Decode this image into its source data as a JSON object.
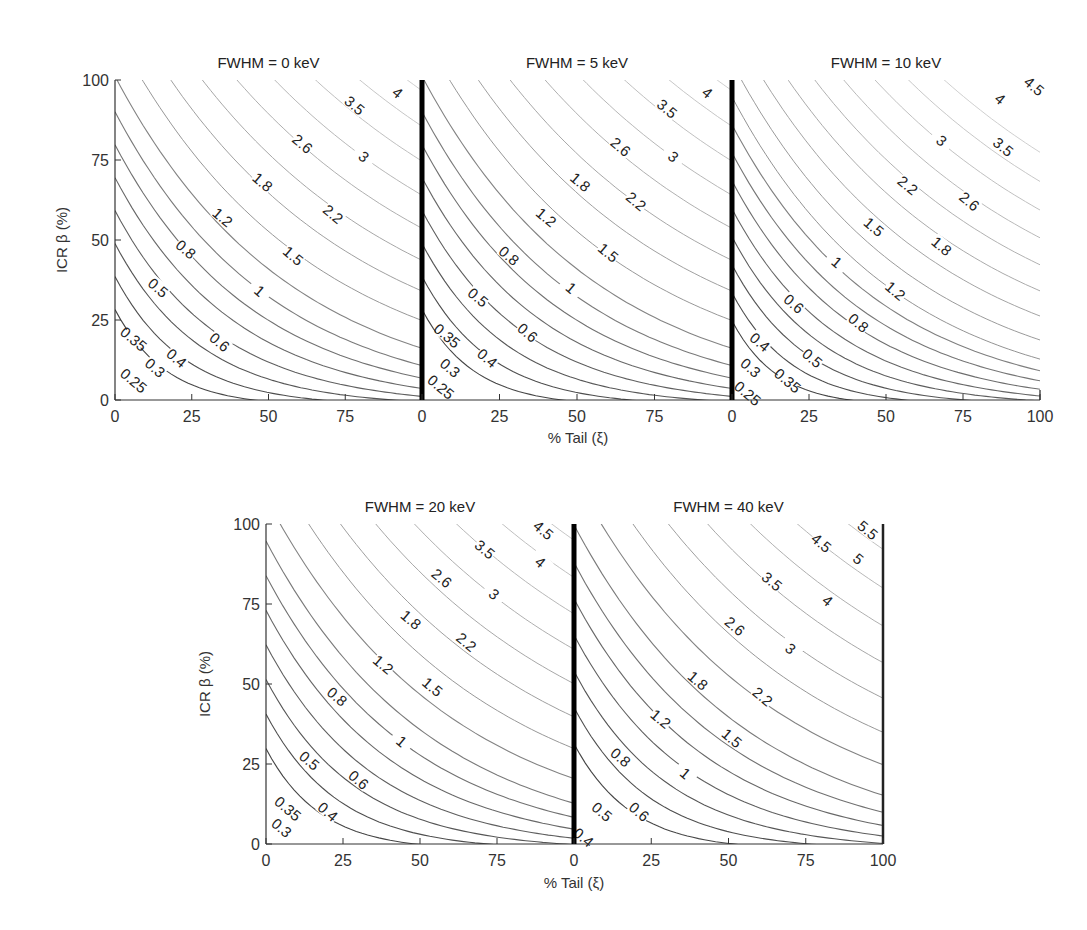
{
  "chart_data": {
    "type": "contour",
    "xlabel": "% Tail (ξ)",
    "ylabel": "ICR β (%)",
    "xlim": [
      0,
      100
    ],
    "ylim": [
      0,
      100
    ],
    "x_ticks": [
      "0",
      "25",
      "50",
      "75"
    ],
    "x_ticks_last": [
      "0",
      "25",
      "50",
      "75",
      "100"
    ],
    "y_ticks": [
      "0",
      "25",
      "50",
      "75",
      "100"
    ],
    "grid": false,
    "panels": [
      {
        "title": "FWHM = 0 keV",
        "levels": [
          0.25,
          0.3,
          0.35,
          0.4,
          0.5,
          0.6,
          0.8,
          1,
          1.2,
          1.5,
          1.8,
          2.2,
          2.6,
          3,
          3.5,
          4
        ],
        "label_positions": [
          {
            "v": "0.25",
            "x": 6,
            "y": 6
          },
          {
            "v": "0.3",
            "x": 13,
            "y": 10
          },
          {
            "v": "0.35",
            "x": 6,
            "y": 19
          },
          {
            "v": "0.4",
            "x": 20,
            "y": 13
          },
          {
            "v": "0.5",
            "x": 14,
            "y": 35
          },
          {
            "v": "0.6",
            "x": 34,
            "y": 18
          },
          {
            "v": "0.8",
            "x": 23,
            "y": 47
          },
          {
            "v": "1",
            "x": 47,
            "y": 34
          },
          {
            "v": "1.2",
            "x": 35,
            "y": 57
          },
          {
            "v": "1.5",
            "x": 58,
            "y": 45
          },
          {
            "v": "1.8",
            "x": 48,
            "y": 68
          },
          {
            "v": "2.2",
            "x": 71,
            "y": 58
          },
          {
            "v": "2.6",
            "x": 61,
            "y": 80
          },
          {
            "v": "3",
            "x": 81,
            "y": 76
          },
          {
            "v": "3.5",
            "x": 78,
            "y": 92
          },
          {
            "v": "4",
            "x": 92,
            "y": 96
          }
        ]
      },
      {
        "title": "FWHM = 5 keV",
        "levels": [
          0.25,
          0.3,
          0.35,
          0.4,
          0.5,
          0.6,
          0.8,
          1,
          1.2,
          1.5,
          1.8,
          2.2,
          2.6,
          3,
          3.5,
          4
        ],
        "label_positions": [
          {
            "v": "0.25",
            "x": 6,
            "y": 4
          },
          {
            "v": "0.3",
            "x": 9,
            "y": 10
          },
          {
            "v": "0.35",
            "x": 8,
            "y": 20
          },
          {
            "v": "0.4",
            "x": 21,
            "y": 13
          },
          {
            "v": "0.5",
            "x": 18,
            "y": 32
          },
          {
            "v": "0.6",
            "x": 34,
            "y": 21
          },
          {
            "v": "0.8",
            "x": 28,
            "y": 45
          },
          {
            "v": "1",
            "x": 48,
            "y": 35
          },
          {
            "v": "1.2",
            "x": 40,
            "y": 57
          },
          {
            "v": "1.5",
            "x": 60,
            "y": 46
          },
          {
            "v": "1.8",
            "x": 51,
            "y": 68
          },
          {
            "v": "2.2",
            "x": 69,
            "y": 62
          },
          {
            "v": "2.6",
            "x": 64,
            "y": 79
          },
          {
            "v": "3",
            "x": 81,
            "y": 76
          },
          {
            "v": "3.5",
            "x": 79,
            "y": 91
          },
          {
            "v": "4",
            "x": 92,
            "y": 96
          }
        ]
      },
      {
        "title": "FWHM = 10 keV",
        "levels": [
          0.25,
          0.3,
          0.35,
          0.4,
          0.5,
          0.6,
          0.8,
          1,
          1.2,
          1.5,
          1.8,
          2.2,
          2.6,
          3,
          3.5,
          4,
          4.5
        ],
        "label_positions": [
          {
            "v": "0.25",
            "x": 5,
            "y": 2
          },
          {
            "v": "0.3",
            "x": 6,
            "y": 10
          },
          {
            "v": "0.35",
            "x": 18,
            "y": 6
          },
          {
            "v": "0.4",
            "x": 9,
            "y": 18
          },
          {
            "v": "0.5",
            "x": 26,
            "y": 13
          },
          {
            "v": "0.6",
            "x": 20,
            "y": 30
          },
          {
            "v": "0.8",
            "x": 41,
            "y": 24
          },
          {
            "v": "1",
            "x": 34,
            "y": 43
          },
          {
            "v": "1.2",
            "x": 53,
            "y": 34
          },
          {
            "v": "1.5",
            "x": 46,
            "y": 54
          },
          {
            "v": "1.8",
            "x": 68,
            "y": 48
          },
          {
            "v": "2.2",
            "x": 57,
            "y": 67
          },
          {
            "v": "2.6",
            "x": 77,
            "y": 62
          },
          {
            "v": "3",
            "x": 68,
            "y": 81
          },
          {
            "v": "3.5",
            "x": 88,
            "y": 79
          },
          {
            "v": "4",
            "x": 87,
            "y": 94
          },
          {
            "v": "4.5",
            "x": 98,
            "y": 98
          }
        ]
      },
      {
        "title": "FWHM = 20 keV",
        "levels": [
          0.3,
          0.35,
          0.4,
          0.5,
          0.6,
          0.8,
          1,
          1.2,
          1.5,
          1.8,
          2.2,
          2.6,
          3,
          3.5,
          4,
          4.5
        ],
        "label_positions": [
          {
            "v": "0.3",
            "x": 5,
            "y": 5
          },
          {
            "v": "0.35",
            "x": 7,
            "y": 11
          },
          {
            "v": "0.4",
            "x": 20,
            "y": 10
          },
          {
            "v": "0.5",
            "x": 14,
            "y": 26
          },
          {
            "v": "0.6",
            "x": 30,
            "y": 20
          },
          {
            "v": "0.8",
            "x": 23,
            "y": 46
          },
          {
            "v": "1",
            "x": 44,
            "y": 32
          },
          {
            "v": "1.2",
            "x": 38,
            "y": 56
          },
          {
            "v": "1.5",
            "x": 54,
            "y": 49
          },
          {
            "v": "1.8",
            "x": 47,
            "y": 70
          },
          {
            "v": "2.2",
            "x": 65,
            "y": 63
          },
          {
            "v": "2.6",
            "x": 57,
            "y": 83
          },
          {
            "v": "3",
            "x": 74,
            "y": 78
          },
          {
            "v": "3.5",
            "x": 71,
            "y": 92
          },
          {
            "v": "4",
            "x": 89,
            "y": 88
          },
          {
            "v": "4.5",
            "x": 90,
            "y": 98
          }
        ]
      },
      {
        "title": "FWHM = 40 keV",
        "levels": [
          0.4,
          0.5,
          0.6,
          0.8,
          1,
          1.2,
          1.5,
          1.8,
          2.2,
          2.6,
          3,
          3.5,
          4,
          4.5,
          5,
          5.5
        ],
        "label_positions": [
          {
            "v": "0.4",
            "x": 3,
            "y": 2
          },
          {
            "v": "0.5",
            "x": 9,
            "y": 10
          },
          {
            "v": "0.6",
            "x": 21,
            "y": 10
          },
          {
            "v": "0.8",
            "x": 15,
            "y": 27
          },
          {
            "v": "1",
            "x": 36,
            "y": 22
          },
          {
            "v": "1.2",
            "x": 28,
            "y": 39
          },
          {
            "v": "1.5",
            "x": 51,
            "y": 33
          },
          {
            "v": "1.8",
            "x": 40,
            "y": 51
          },
          {
            "v": "2.2",
            "x": 61,
            "y": 46
          },
          {
            "v": "2.6",
            "x": 52,
            "y": 68
          },
          {
            "v": "3",
            "x": 70,
            "y": 61
          },
          {
            "v": "3.5",
            "x": 64,
            "y": 82
          },
          {
            "v": "4",
            "x": 82,
            "y": 76
          },
          {
            "v": "4.5",
            "x": 80,
            "y": 94
          },
          {
            "v": "5",
            "x": 92,
            "y": 89
          },
          {
            "v": "5.5",
            "x": 95,
            "y": 98
          }
        ]
      }
    ]
  },
  "figure": {
    "xlabel_top": "% Tail (ξ)",
    "xlabel_bottom": "% Tail (ξ)",
    "ylabel_top": "ICR β (%)",
    "ylabel_bottom": "ICR β (%)"
  }
}
